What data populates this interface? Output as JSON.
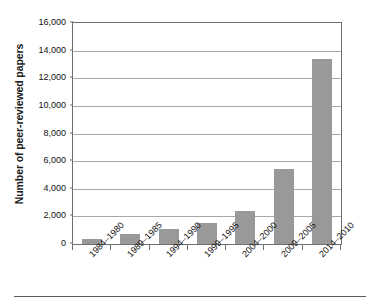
{
  "chart_data": {
    "type": "bar",
    "title": "",
    "subtitle": "",
    "xlabel": "",
    "ylabel": "Number of peer-reviewed papers",
    "categories": [
      "1980–1984",
      "1985–1989",
      "1990–1994",
      "1995–1999",
      "2000–2004",
      "2005–2009",
      "2010–2014"
    ],
    "values": [
      360,
      750,
      1100,
      1550,
      2400,
      5400,
      13400
    ],
    "ylim": [
      0,
      16000
    ],
    "ytick_values": [
      0,
      2000,
      4000,
      6000,
      8000,
      10000,
      12000,
      14000,
      16000
    ],
    "ytick_labels": [
      "0",
      "2,000",
      "4,000",
      "6,000",
      "8,000",
      "10,000",
      "12,000",
      "14,000",
      "16,000"
    ],
    "grid": "horizontal",
    "legend": "none",
    "bar_color": "#999999",
    "gridline_color": "#a8a8a8",
    "axis_color": "#6f6f6f",
    "text_color": "#111111",
    "xtick_label_rotation": -45
  },
  "figure": {
    "background_color": "#ffffff",
    "footer_rule_color": "#5a5a5a"
  }
}
